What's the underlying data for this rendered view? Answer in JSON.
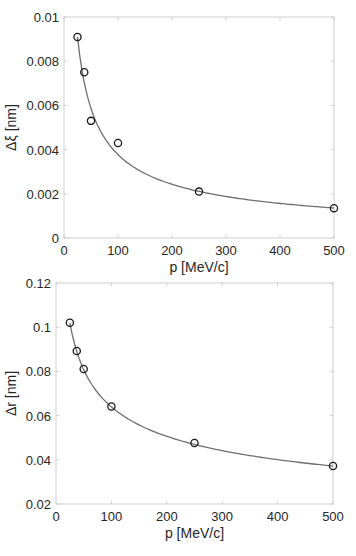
{
  "chart_data": [
    {
      "type": "scatter",
      "title": "",
      "xlabel": "p [MeV/c]",
      "ylabel": "Δξ [nm]",
      "xlim": [
        0,
        500
      ],
      "ylim": [
        0,
        0.01
      ],
      "xticks": [
        0,
        100,
        200,
        300,
        400,
        500
      ],
      "xtick_labels": [
        "0",
        "100",
        "200",
        "300",
        "400",
        "500"
      ],
      "yticks": [
        0,
        0.002,
        0.004,
        0.006,
        0.008,
        0.01
      ],
      "ytick_labels": [
        "0",
        "0.002",
        "0.004",
        "0.006",
        "0.008",
        "0.01"
      ],
      "grid": false,
      "legend": null,
      "series": [
        {
          "name": "data",
          "marker": "circle",
          "x": [
            25,
            37.5,
            50,
            100,
            250,
            500
          ],
          "y": [
            0.0091,
            0.0075,
            0.0053,
            0.0043,
            0.0021,
            0.00135
          ]
        },
        {
          "name": "fit",
          "style": "line",
          "model": "y = A * p^(-k)",
          "A": 0.0091,
          "p0": 25,
          "k": 0.635,
          "x_range": [
            25,
            500
          ]
        }
      ],
      "colors": {
        "marker": "#1a1a1a",
        "line": "#6e6e6e",
        "axis": "#cfcfcf"
      }
    },
    {
      "type": "scatter",
      "title": "",
      "xlabel": "p [MeV/c]",
      "ylabel": "Δr [nm]",
      "xlim": [
        0,
        500
      ],
      "ylim": [
        0.02,
        0.12
      ],
      "xticks": [
        0,
        100,
        200,
        300,
        400,
        500
      ],
      "xtick_labels": [
        "0",
        "100",
        "200",
        "300",
        "400",
        "500"
      ],
      "yticks": [
        0.02,
        0.04,
        0.06,
        0.08,
        0.1,
        0.12
      ],
      "ytick_labels": [
        "0.02",
        "0.04",
        "0.06",
        "0.08",
        "0.1",
        "0.12"
      ],
      "grid": false,
      "legend": null,
      "series": [
        {
          "name": "data",
          "marker": "circle",
          "x": [
            25,
            37.5,
            50,
            100,
            250,
            500
          ],
          "y": [
            0.102,
            0.0892,
            0.0811,
            0.0641,
            0.0476,
            0.0372
          ]
        },
        {
          "name": "fit",
          "style": "line",
          "model": "y = A * p^(-k)",
          "A": 0.102,
          "p0": 25,
          "k": 0.337,
          "x_range": [
            25,
            500
          ]
        }
      ],
      "colors": {
        "marker": "#1a1a1a",
        "line": "#6e6e6e",
        "axis": "#cfcfcf"
      }
    }
  ],
  "layout": {
    "plots": [
      {
        "left": 64,
        "top": 17,
        "right": 334,
        "bottom": 238
      },
      {
        "left": 56,
        "top": 283,
        "right": 333,
        "bottom": 504
      }
    ]
  }
}
